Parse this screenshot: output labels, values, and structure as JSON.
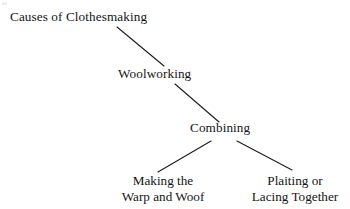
{
  "diagram": {
    "type": "hierarchy-tree",
    "background_color": "#ffffff",
    "text_color": "#141414",
    "line_color": "#1e1e1e",
    "root": {
      "label": "Causes of Clothesmaking"
    },
    "level2": {
      "label": "Woolworking"
    },
    "level3": {
      "label": "Combining"
    },
    "leaves": [
      {
        "line1": "Making the",
        "line2": "Warp and Woof"
      },
      {
        "line1": "Plaiting or",
        "line2": "Lacing Together"
      }
    ],
    "edges": [
      {
        "name": "root-to-woolworking",
        "x1": 117,
        "y1": 27,
        "x2": 164,
        "y2": 66
      },
      {
        "name": "woolworking-to-combining",
        "x1": 175,
        "y1": 84,
        "x2": 219,
        "y2": 122
      },
      {
        "name": "combining-to-making-warp-and-woof",
        "x1": 211,
        "y1": 141,
        "x2": 158,
        "y2": 172
      },
      {
        "name": "combining-to-plaiting-or-lacing",
        "x1": 237,
        "y1": 141,
        "x2": 292,
        "y2": 170
      }
    ]
  }
}
